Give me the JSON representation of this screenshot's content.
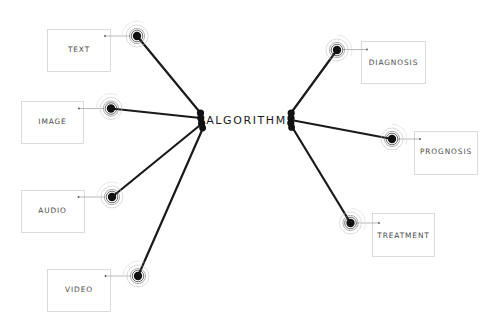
{
  "diagram": {
    "hub": {
      "label": "ALGORITHM"
    },
    "inputs": [
      {
        "label": "TEXT"
      },
      {
        "label": "IMAGE"
      },
      {
        "label": "AUDIO"
      },
      {
        "label": "VIDEO"
      }
    ],
    "outputs": [
      {
        "label": "DIAGNOSIS"
      },
      {
        "label": "PROGNOSIS"
      },
      {
        "label": "TREATMENT"
      }
    ],
    "colors": {
      "background": "#ffffff",
      "spoke": "#1a1a1a",
      "box_border": "#d2d2d2",
      "box_text": "#4a4a4a",
      "hub_text": "#1a1a1a"
    }
  }
}
